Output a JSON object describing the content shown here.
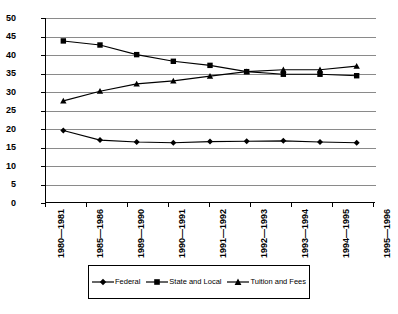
{
  "chart_data": {
    "type": "line",
    "title": "",
    "subtitle": "",
    "xlabel": "",
    "ylabel": "",
    "ylim": [
      0,
      50
    ],
    "ytick_step": 5,
    "grid": true,
    "legend_position": "bottom",
    "categories": [
      "1980—1981",
      "1985—1986",
      "1989—1990",
      "1990—1991",
      "1991—1992",
      "1992—1993",
      "1993—1994",
      "1994—1995",
      "1995—1996"
    ],
    "yticks": [
      "0",
      "5",
      "10",
      "15",
      "20",
      "25",
      "30",
      "35",
      "40",
      "45",
      "50"
    ],
    "series": [
      {
        "name": "Federal",
        "marker": "diamond",
        "color": "#000000",
        "values": [
          19.6,
          17.0,
          16.5,
          16.3,
          16.6,
          16.7,
          16.8,
          16.5,
          16.3
        ]
      },
      {
        "name": "State and Local",
        "marker": "square",
        "color": "#000000",
        "values": [
          43.8,
          42.7,
          40.1,
          38.3,
          37.2,
          35.5,
          34.8,
          34.8,
          34.4
        ]
      },
      {
        "name": "Tuition and Fees",
        "marker": "triangle",
        "color": "#000000",
        "values": [
          27.6,
          30.2,
          32.2,
          33.0,
          34.3,
          35.5,
          36.0,
          36.0,
          37.0
        ]
      }
    ]
  },
  "legend": {
    "items": [
      {
        "label": "Federal",
        "marker": "diamond"
      },
      {
        "label": "State and Local",
        "marker": "square"
      },
      {
        "label": "Tuition and Fees",
        "marker": "triangle"
      }
    ]
  }
}
